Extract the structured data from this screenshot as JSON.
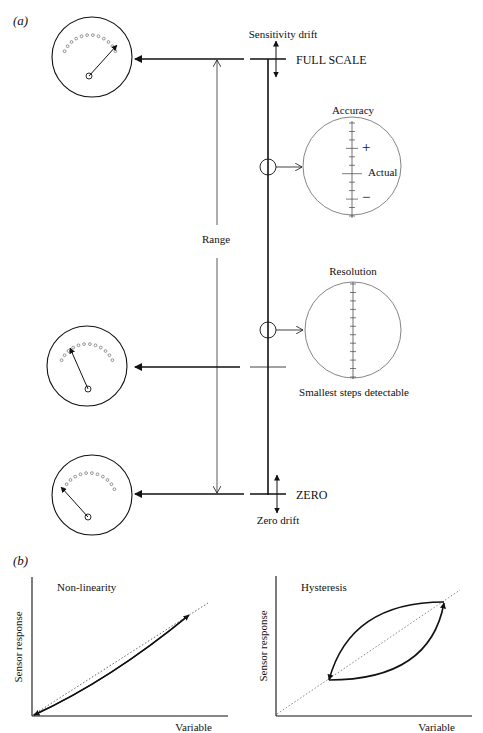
{
  "panel_a": {
    "label": "(a)",
    "sensitivity_drift": "Sensitivity drift",
    "full_scale": "FULL SCALE",
    "range": "Range",
    "accuracy": {
      "title": "Accuracy",
      "plus": "+",
      "actual": "Actual",
      "minus": "−"
    },
    "resolution": {
      "title": "Resolution",
      "caption": "Smallest steps detectable"
    },
    "zero": "ZERO",
    "zero_drift": "Zero drift",
    "dials": [
      {
        "name": "full-scale-dial",
        "needle_position": "full"
      },
      {
        "name": "mid-scale-dial",
        "needle_position": "low"
      },
      {
        "name": "zero-dial",
        "needle_position": "zero"
      }
    ]
  },
  "panel_b": {
    "label": "(b)",
    "plots": [
      {
        "title": "Non-linearity",
        "xlabel": "Variable",
        "ylabel": "Sensor response"
      },
      {
        "title": "Hysteresis",
        "xlabel": "Variable",
        "ylabel": "Sensor response"
      }
    ]
  },
  "colors": {
    "ink": "#111111",
    "light_ink": "#777777",
    "background": "#ffffff"
  }
}
